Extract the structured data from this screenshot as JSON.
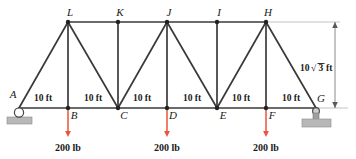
{
  "diagram": {
    "colors": {
      "member": "#3a3a3a",
      "load_arrow": "#e8553c",
      "support_fill": "#b8b8b8",
      "dimension_line": "#8a8a8a",
      "text": "#1a1a1a"
    },
    "top_chord_nodes": [
      {
        "id": "L",
        "label": "L",
        "x": 68,
        "y": 22
      },
      {
        "id": "K",
        "label": "K",
        "x": 118,
        "y": 22
      },
      {
        "id": "J",
        "label": "J",
        "x": 167,
        "y": 22
      },
      {
        "id": "I",
        "label": "I",
        "x": 217,
        "y": 22
      },
      {
        "id": "H",
        "label": "H",
        "x": 266,
        "y": 22
      }
    ],
    "bottom_chord_nodes": [
      {
        "id": "A",
        "label": "A",
        "x": 19,
        "y": 108
      },
      {
        "id": "B",
        "label": "B",
        "x": 68,
        "y": 108
      },
      {
        "id": "C",
        "label": "C",
        "x": 118,
        "y": 108
      },
      {
        "id": "D",
        "label": "D",
        "x": 167,
        "y": 108
      },
      {
        "id": "E",
        "label": "E",
        "x": 217,
        "y": 108
      },
      {
        "id": "F",
        "label": "F",
        "x": 266,
        "y": 108
      },
      {
        "id": "G",
        "label": "G",
        "x": 316,
        "y": 108
      }
    ],
    "members": [
      {
        "name": "bottom-chord-A-G",
        "x1": 19,
        "y1": 108,
        "x2": 316,
        "y2": 108
      },
      {
        "name": "top-chord-L-H",
        "x1": 68,
        "y1": 22,
        "x2": 266,
        "y2": 22
      },
      {
        "name": "diagonal-A-L",
        "x1": 19,
        "y1": 108,
        "x2": 68,
        "y2": 22
      },
      {
        "name": "vertical-L-B",
        "x1": 68,
        "y1": 22,
        "x2": 68,
        "y2": 108
      },
      {
        "name": "diagonal-L-C",
        "x1": 68,
        "y1": 22,
        "x2": 118,
        "y2": 108
      },
      {
        "name": "vertical-K-C",
        "x1": 118,
        "y1": 22,
        "x2": 118,
        "y2": 108
      },
      {
        "name": "diagonal-C-J",
        "x1": 118,
        "y1": 108,
        "x2": 167,
        "y2": 22
      },
      {
        "name": "vertical-J-D",
        "x1": 167,
        "y1": 22,
        "x2": 167,
        "y2": 108
      },
      {
        "name": "diagonal-J-E",
        "x1": 167,
        "y1": 22,
        "x2": 217,
        "y2": 108
      },
      {
        "name": "vertical-I-E",
        "x1": 217,
        "y1": 22,
        "x2": 217,
        "y2": 108
      },
      {
        "name": "diagonal-E-H",
        "x1": 217,
        "y1": 108,
        "x2": 266,
        "y2": 22
      },
      {
        "name": "vertical-H-F",
        "x1": 266,
        "y1": 22,
        "x2": 266,
        "y2": 108
      },
      {
        "name": "diagonal-H-G",
        "x1": 266,
        "y1": 22,
        "x2": 316,
        "y2": 108
      }
    ],
    "span_dimensions": [
      {
        "label": "10 ft",
        "x": 43,
        "y": 101
      },
      {
        "label": "10 ft",
        "x": 93,
        "y": 101
      },
      {
        "label": "10 ft",
        "x": 142,
        "y": 101
      },
      {
        "label": "10 ft",
        "x": 192,
        "y": 101
      },
      {
        "label": "10 ft",
        "x": 241,
        "y": 101
      },
      {
        "label": "10 ft",
        "x": 291,
        "y": 101
      }
    ],
    "height_dimension": {
      "name": "height-dimension",
      "prefix": "10",
      "radicand": "3",
      "suffix": "ft",
      "full_text": "10√3 ft",
      "line_x": 335,
      "y_top": 22,
      "y_bottom": 108,
      "label_x": 318,
      "label_y": 68
    },
    "loads": [
      {
        "name": "load-at-B",
        "label": "200 lb",
        "node": "B",
        "x": 68,
        "y_start": 110,
        "y_end": 137,
        "label_y": 151
      },
      {
        "name": "load-at-D",
        "label": "200 lb",
        "node": "D",
        "x": 167,
        "y_start": 110,
        "y_end": 137,
        "label_y": 151
      },
      {
        "name": "load-at-F",
        "label": "200 lb",
        "node": "F",
        "x": 266,
        "y_start": 110,
        "y_end": 137,
        "label_y": 151
      }
    ],
    "supports": [
      {
        "name": "roller-support-A",
        "type": "roller",
        "x": 19,
        "y": 108
      },
      {
        "name": "pin-support-G",
        "type": "pin",
        "x": 316,
        "y": 108
      }
    ]
  }
}
